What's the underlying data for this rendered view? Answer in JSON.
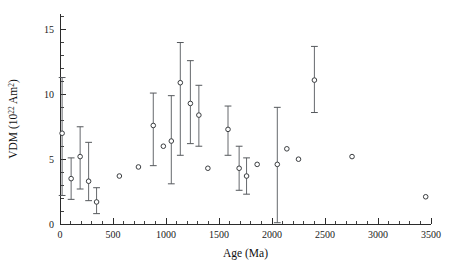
{
  "figure": {
    "background_color": "#ffffff",
    "axis_color": "#2b2b2b",
    "marker_edge_color": "#3a3d40",
    "marker_fill_color": "#ffffff",
    "errorbar_color": "#55585c"
  },
  "axes": {
    "x_title": "Age (Ma)",
    "y_title_main": "VDM (10",
    "y_title_sup1": "22",
    "y_title_mid": " Am",
    "y_title_sup2": "2",
    "y_title_end": ")",
    "y_title_plain": "VDM (10^22 Am^2)",
    "x_tick_labels": [
      "0",
      "500",
      "1000",
      "1500",
      "2000",
      "2500",
      "3000",
      "3500"
    ],
    "x_tick_values": [
      0,
      500,
      1000,
      1500,
      2000,
      2500,
      3000,
      3500
    ],
    "y_tick_labels": [
      "0",
      "5",
      "10",
      "15"
    ],
    "y_tick_values": [
      0,
      5,
      10,
      15
    ]
  },
  "chart_data": {
    "type": "scatter",
    "title": "",
    "xlabel": "Age (Ma)",
    "ylabel": "VDM (10^22 Am^2)",
    "xlim": [
      0,
      3500
    ],
    "ylim": [
      0,
      16.2
    ],
    "grid": false,
    "legend": null,
    "x_minor_tick_step": 100,
    "y_minor_tick_step": 1,
    "marker": "open-circle",
    "error_bars": "vertical (y) with caps",
    "series": [
      {
        "name": "VDM",
        "points": [
          {
            "x": 20,
            "y": 7.0,
            "yerr_low": 4.8,
            "yerr_high": 4.3
          },
          {
            "x": 105,
            "y": 3.5,
            "yerr_low": 1.6,
            "yerr_high": 1.6
          },
          {
            "x": 190,
            "y": 5.2,
            "yerr_low": 2.5,
            "yerr_high": 2.3
          },
          {
            "x": 270,
            "y": 3.3,
            "yerr_low": 1.5,
            "yerr_high": 3.0
          },
          {
            "x": 345,
            "y": 1.7,
            "yerr_low": 0.9,
            "yerr_high": 1.1
          },
          {
            "x": 560,
            "y": 3.7,
            "yerr_low": 0.0,
            "yerr_high": 0.0
          },
          {
            "x": 740,
            "y": 4.4,
            "yerr_low": 0.0,
            "yerr_high": 0.0
          },
          {
            "x": 880,
            "y": 7.6,
            "yerr_low": 3.1,
            "yerr_high": 2.5
          },
          {
            "x": 975,
            "y": 6.0,
            "yerr_low": 0.0,
            "yerr_high": 0.0
          },
          {
            "x": 1050,
            "y": 6.4,
            "yerr_low": 3.3,
            "yerr_high": 3.5
          },
          {
            "x": 1135,
            "y": 10.9,
            "yerr_low": 5.6,
            "yerr_high": 3.1
          },
          {
            "x": 1230,
            "y": 9.3,
            "yerr_low": 3.1,
            "yerr_high": 3.3
          },
          {
            "x": 1310,
            "y": 8.4,
            "yerr_low": 2.4,
            "yerr_high": 2.3
          },
          {
            "x": 1395,
            "y": 4.3,
            "yerr_low": 0.0,
            "yerr_high": 0.0
          },
          {
            "x": 1585,
            "y": 7.3,
            "yerr_low": 2.0,
            "yerr_high": 1.8
          },
          {
            "x": 1690,
            "y": 4.3,
            "yerr_low": 1.7,
            "yerr_high": 1.7
          },
          {
            "x": 1760,
            "y": 3.7,
            "yerr_low": 1.4,
            "yerr_high": 1.4
          },
          {
            "x": 1860,
            "y": 4.6,
            "yerr_low": 0.0,
            "yerr_high": 0.0
          },
          {
            "x": 2050,
            "y": 4.6,
            "yerr_low": 4.5,
            "yerr_high": 4.4
          },
          {
            "x": 2140,
            "y": 5.8,
            "yerr_low": 0.0,
            "yerr_high": 0.0
          },
          {
            "x": 2250,
            "y": 5.0,
            "yerr_low": 0.0,
            "yerr_high": 0.0
          },
          {
            "x": 2400,
            "y": 11.1,
            "yerr_low": 2.5,
            "yerr_high": 2.6
          },
          {
            "x": 2755,
            "y": 5.2,
            "yerr_low": 0.0,
            "yerr_high": 0.0
          },
          {
            "x": 3450,
            "y": 2.1,
            "yerr_low": 0.0,
            "yerr_high": 0.0
          }
        ]
      }
    ]
  }
}
